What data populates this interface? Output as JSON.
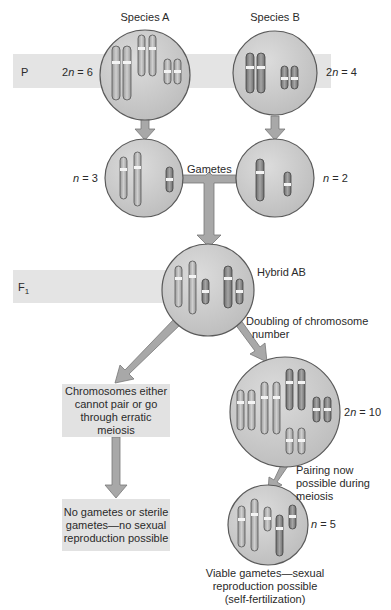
{
  "generations": {
    "p": {
      "label": "P"
    },
    "f1": {
      "label": "F",
      "subscript": "1"
    }
  },
  "species_a": {
    "title": "Species A",
    "ploidy_prefix": "2",
    "ploidy_var": "n",
    "ploidy_value": " = 6",
    "gamete_var": "n",
    "gamete_value": " = 3"
  },
  "species_b": {
    "title": "Species B",
    "ploidy_prefix": "2",
    "ploidy_var": "n",
    "ploidy_value": " = 4",
    "gamete_var": "n",
    "gamete_value": " = 2"
  },
  "gametes_label": "Gametes",
  "hybrid": {
    "title": "Hybrid AB"
  },
  "doubling_label_line1": "Doubling of chromosome",
  "doubling_label_line2": "number",
  "left_branch": {
    "box1": "Chromosomes either cannot pair or go through erratic meiosis",
    "box2": "No gametes or sterile gametes—no sexual reproduction possible"
  },
  "right_branch": {
    "doubled": {
      "ploidy_prefix": "2",
      "ploidy_var": "n",
      "ploidy_value": " = 10"
    },
    "pairing_line1": "Pairing now",
    "pairing_line2": "possible during",
    "pairing_line3": "meiosis",
    "gamete": {
      "ploidy_var": "n",
      "ploidy_value": " = 5"
    },
    "result_line1": "Viable gametes—sexual",
    "result_line2": "reproduction possible",
    "result_line3": "(self-fertilization)"
  },
  "colors": {
    "band": "#e4e4e4",
    "circle_fill": "#c8c8c8",
    "circle_stroke": "#5a5a5a",
    "chromosome_light": "#b9b9b9",
    "chromosome_dark": "#8a8a8a",
    "arrow": "#a8a8a8",
    "box": "#e2e2e2"
  }
}
